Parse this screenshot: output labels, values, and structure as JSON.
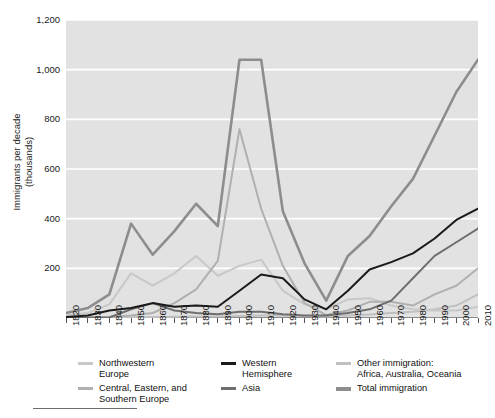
{
  "axes": {
    "ylabel_line1": "Immigrants per decade",
    "ylabel_line2": "(thousands)",
    "yticks": [
      "1,200",
      "1,000",
      "800",
      "600",
      "400",
      "200"
    ],
    "xticks": [
      "1820",
      "1830",
      "1840",
      "1850",
      "1860",
      "1870",
      "1880",
      "1890",
      "1900",
      "1910",
      "1920",
      "1930",
      "1940",
      "1950",
      "1960",
      "1970",
      "1980",
      "1990",
      "2000",
      "2010"
    ]
  },
  "legend": {
    "items": [
      {
        "label": "Northwestern\nEurope",
        "line1": "Northwestern",
        "line2": "Europe",
        "color": "#c8c8c8"
      },
      {
        "label": "Central, Eastern, and\nSouthern Europe",
        "line1": "Central, Eastern, and",
        "line2": "Southern Europe",
        "color": "#b0b0b0"
      },
      {
        "label": "Western\nHemisphere",
        "line1": "Western",
        "line2": "Hemisphere",
        "color": "#1a1a1a"
      },
      {
        "label": "Asia",
        "line1": "Asia",
        "line2": "",
        "color": "#6e6e6e"
      },
      {
        "label": "Other immigration:\nAfrica, Australia, Oceania",
        "line1": "Other immigration:",
        "line2": "Africa, Australia, Oceania",
        "color": "#c0c0c0"
      },
      {
        "label": "Total immigration",
        "line1": "Total immigration",
        "line2": "",
        "color": "#8d8d8d"
      }
    ]
  },
  "chart_data": {
    "type": "line",
    "title": "",
    "xlabel": "",
    "ylabel": "Immigrants per decade (thousands)",
    "xlim": [
      1820,
      2010
    ],
    "ylim": [
      0,
      1200
    ],
    "grid": true,
    "legend_position": "below",
    "plot_background": "#e2e2e2",
    "gridline_color": "#ffffff",
    "x": [
      1820,
      1830,
      1840,
      1850,
      1860,
      1870,
      1880,
      1890,
      1900,
      1910,
      1920,
      1930,
      1940,
      1950,
      1960,
      1970,
      1980,
      1990,
      2000,
      2010
    ],
    "series": [
      {
        "name": "Northwestern Europe",
        "color": "#c8c8c8",
        "values": [
          10,
          20,
          55,
          180,
          130,
          180,
          250,
          170,
          210,
          235,
          110,
          55,
          35,
          75,
          80,
          50,
          35,
          30,
          30,
          45
        ]
      },
      {
        "name": "Central, Eastern, and Southern Europe",
        "color": "#b0b0b0",
        "values": [
          2,
          3,
          5,
          10,
          20,
          60,
          115,
          230,
          760,
          440,
          210,
          60,
          12,
          30,
          65,
          65,
          50,
          95,
          130,
          200
        ]
      },
      {
        "name": "Western Hemisphere",
        "color": "#1a1a1a",
        "values": [
          4,
          10,
          30,
          40,
          60,
          45,
          50,
          45,
          110,
          175,
          160,
          75,
          35,
          110,
          195,
          225,
          260,
          320,
          395,
          440
        ]
      },
      {
        "name": "Asia",
        "color": "#6e6e6e",
        "values": [
          1,
          1,
          2,
          35,
          60,
          30,
          20,
          15,
          25,
          25,
          15,
          10,
          10,
          20,
          35,
          70,
          160,
          250,
          305,
          360
        ]
      },
      {
        "name": "Other immigration: Africa, Australia, Oceania",
        "color": "#c0c0c0",
        "values": [
          1,
          1,
          2,
          3,
          4,
          5,
          6,
          6,
          8,
          10,
          10,
          8,
          6,
          10,
          14,
          20,
          25,
          35,
          50,
          95
        ]
      },
      {
        "name": "Total immigration",
        "color": "#8d8d8d",
        "values": [
          20,
          40,
          95,
          380,
          255,
          350,
          460,
          370,
          1040,
          1040,
          430,
          220,
          70,
          250,
          330,
          450,
          560,
          735,
          910,
          1040
        ]
      }
    ]
  }
}
